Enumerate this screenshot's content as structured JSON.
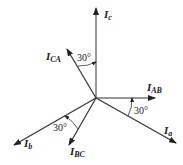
{
  "diagram": {
    "type": "phasor-diagram",
    "phasors": [
      {
        "id": "Ic",
        "main": "I",
        "sub": "c",
        "angle_deg": 90
      },
      {
        "id": "ICA",
        "main": "I",
        "sub": "CA",
        "angle_deg": 120
      },
      {
        "id": "IAB",
        "main": "I",
        "sub": "AB",
        "angle_deg": 0
      },
      {
        "id": "Ia",
        "main": "I",
        "sub": "a",
        "angle_deg": -30
      },
      {
        "id": "Ib",
        "main": "I",
        "sub": "b",
        "angle_deg": 210
      },
      {
        "id": "IBC",
        "main": "I",
        "sub": "BC",
        "angle_deg": 240
      }
    ],
    "angle_labels": {
      "top": "30°",
      "right": "30°",
      "bottom_left": "30°"
    }
  }
}
